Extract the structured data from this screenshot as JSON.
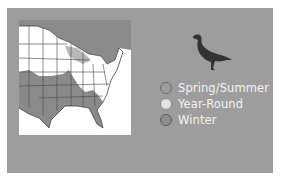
{
  "figure": {
    "map": {
      "region": "Eastern North America",
      "range_color": "#8a8a8a",
      "land_color": "#ffffff",
      "border_color": "#444444"
    },
    "bird_icon": "bird-silhouette-icon",
    "legend": {
      "items": [
        {
          "label": "Spring/Summer",
          "fill": "#9d9d9d",
          "border": "#6a6a6a"
        },
        {
          "label": "Year-Round",
          "fill": "#e4e4e4",
          "border": "#8a8a8a"
        },
        {
          "label": "Winter",
          "fill": "#8e8e8e",
          "border": "#5a5a5a"
        }
      ]
    },
    "colors": {
      "panel_background": "#9d9d9d",
      "legend_text": "#f4f4f4"
    }
  }
}
